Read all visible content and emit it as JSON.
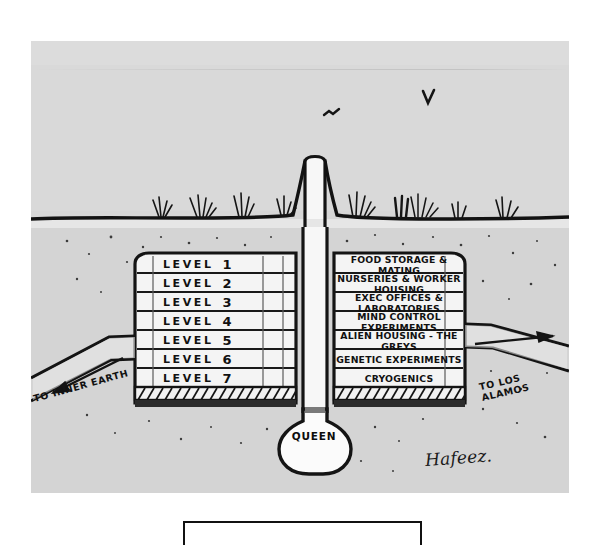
{
  "artwork": {
    "title": "Underground Alien Base Cross-Section",
    "signature": "Hafeez.",
    "medium_colors": {
      "ink": "#111111",
      "sky": "#d9d9d9",
      "soil": "#d4d4d4",
      "paper": "#ffffff",
      "chamber_fill": "#f2f2f2"
    }
  },
  "levels": [
    {
      "word": "LEVEL",
      "number": "1",
      "use": "FOOD STORAGE & MATING"
    },
    {
      "word": "LEVEL",
      "number": "2",
      "use": "NURSERIES & WORKER HOUSING"
    },
    {
      "word": "LEVEL",
      "number": "3",
      "use": "EXEC OFFICES & LABORATORIES"
    },
    {
      "word": "LEVEL",
      "number": "4",
      "use": "MIND CONTROL EXPERIMENTS"
    },
    {
      "word": "LEVEL",
      "number": "5",
      "use": "ALIEN HOUSING - THE GREYS"
    },
    {
      "word": "LEVEL",
      "number": "6",
      "use": "GENETIC EXPERIMENTS"
    },
    {
      "word": "LEVEL",
      "number": "7",
      "use": "CRYOGENICS"
    }
  ],
  "tunnels": {
    "left": {
      "label": "TO INNER EARTH",
      "direction": "left"
    },
    "right": {
      "label": "TO LOS ALAMOS",
      "direction": "right"
    }
  },
  "queen_chamber": {
    "label": "QUEEN"
  },
  "scenery": {
    "birds": 2,
    "grass_tufts": 8,
    "surface_shaft": "central vertical shaft"
  }
}
